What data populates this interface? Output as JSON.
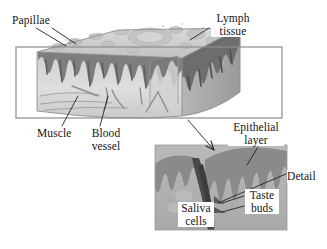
{
  "figure": {
    "kind": "anatomical-diagram",
    "background_color": "#ffffff",
    "ink_color": "#141414"
  },
  "labels": {
    "papillae": "Papillae",
    "lymph_tissue_line1": "Lymph",
    "lymph_tissue_line2": "tissue",
    "muscle": "Muscle",
    "blood_vessel_line1": "Blood",
    "blood_vessel_line2": "vessel",
    "epithelial_layer_line1": "Epithelial",
    "epithelial_layer_line2": "layer",
    "detail": "Detail",
    "taste_buds_line1": "Taste",
    "taste_buds_line2": "buds",
    "saliva_cells_line1": "Saliva",
    "saliva_cells_line2": "cells"
  },
  "main_block": {
    "name": "tongue-tissue-block",
    "outline_rect": {
      "x": 16,
      "y": 47,
      "width": 266,
      "height": 71
    },
    "outline_color": "#8a8a8a",
    "surface_tone": "#c9c9c9",
    "body_tone": "#d8d8d8",
    "epithelium_tone": "#8e8e8e",
    "shadow_tone": "#6f6f6f"
  },
  "detail_panel": {
    "name": "taste-bud-detail",
    "rect": {
      "x": 155,
      "y": 145,
      "width": 132,
      "height": 85
    },
    "base_tone": "#b5b5b5",
    "epithelium_tone": "#8b8b8b",
    "cleft_tone": "#4a4a4a"
  },
  "leader_lines": {
    "color": "#2a2a2a",
    "count": 9
  }
}
